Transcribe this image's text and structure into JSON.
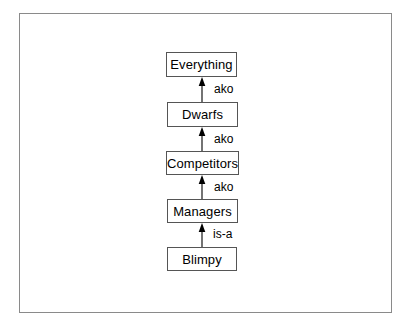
{
  "diagram": {
    "frame": {
      "x": 19,
      "y": 13,
      "width": 373,
      "height": 300,
      "border_color": "#8a8a8a"
    },
    "background_color": "#ffffff",
    "node_border_color": "#555555",
    "node_fill_color": "#ffffff",
    "text_color": "#000000",
    "nodes": [
      {
        "id": "everything",
        "label": "Everything",
        "x": 166,
        "y": 52,
        "width": 71,
        "height": 25
      },
      {
        "id": "dwarfs",
        "label": "Dwarfs",
        "x": 167,
        "y": 102,
        "width": 71,
        "height": 25
      },
      {
        "id": "competitors",
        "label": "Competitors",
        "x": 166,
        "y": 151,
        "width": 73,
        "height": 24
      },
      {
        "id": "managers",
        "label": "Managers",
        "x": 167,
        "y": 199,
        "width": 71,
        "height": 24
      },
      {
        "id": "blimpy",
        "label": "Blimpy",
        "x": 167,
        "y": 247,
        "width": 70,
        "height": 24
      }
    ],
    "edges": [
      {
        "id": "blimpy-managers",
        "from": "blimpy",
        "to": "managers",
        "label": "is-a",
        "x": 199,
        "y": 223,
        "height": 24,
        "label_x": 213,
        "label_y": 228
      },
      {
        "id": "managers-competitors",
        "from": "managers",
        "to": "competitors",
        "label": "ako",
        "x": 199,
        "y": 175,
        "height": 24,
        "label_x": 214,
        "label_y": 181
      },
      {
        "id": "competitors-dwarfs",
        "from": "competitors",
        "to": "dwarfs",
        "label": "ako",
        "x": 199,
        "y": 127,
        "height": 24,
        "label_x": 214,
        "label_y": 133
      },
      {
        "id": "dwarfs-everything",
        "from": "dwarfs",
        "to": "everything",
        "label": "ako",
        "x": 199,
        "y": 77,
        "height": 25,
        "label_x": 214,
        "label_y": 83
      }
    ]
  }
}
